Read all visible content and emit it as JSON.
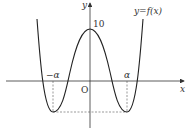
{
  "diagram": {
    "function_label": "y=f(x)",
    "axis_x_label": "x",
    "axis_y_label": "y",
    "origin_label": "O",
    "y_intercept_label": "10",
    "neg_alpha_label": "−α",
    "alpha_label": "α",
    "colors": {
      "curve": "#222222",
      "axis": "#333333",
      "dashed": "#555555"
    }
  }
}
